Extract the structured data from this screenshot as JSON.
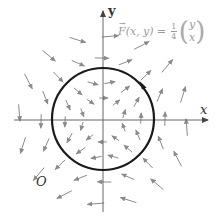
{
  "figure": {
    "type": "vector-field-diagram",
    "field_formula": {
      "lhs": "F(x, y)",
      "equals": "=",
      "coefficient_numerator": "1",
      "coefficient_denominator": "4",
      "vector_top": "y",
      "vector_bottom": "x"
    },
    "axes": {
      "x_label": "x",
      "y_label": "y",
      "origin_label": "O"
    },
    "curve": {
      "shape": "circle",
      "orientation": "counterclockwise",
      "color": "#1a1a1a"
    },
    "colors": {
      "axis": "#555555",
      "arrow": "#8a8a8a",
      "formula": "#9a9a9a"
    }
  }
}
